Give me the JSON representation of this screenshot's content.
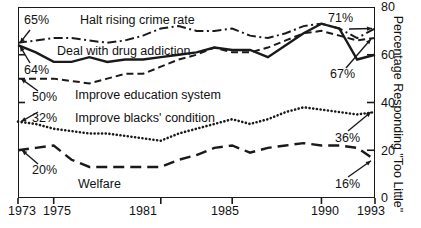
{
  "chart_data": {
    "type": "line",
    "title": "",
    "xlabel": "",
    "ylabel": "Percentage Responding \"Too Little\"",
    "xlim": [
      1973,
      1993
    ],
    "ylim": [
      0,
      80
    ],
    "grid": false,
    "legend_position": "inline-labels",
    "x_ticks": [
      1973,
      1975,
      1981,
      1985,
      1990,
      1993
    ],
    "x_tick_labels": [
      "1973",
      "1975",
      "1981",
      "1985",
      "1990",
      "1993"
    ],
    "y_ticks": [
      0,
      20,
      40,
      60,
      80
    ],
    "y_tick_labels": [
      "0",
      "20",
      "40",
      "60",
      "80"
    ],
    "y_axis_side": "right",
    "x": [
      1973,
      1974,
      1975,
      1976,
      1977,
      1978,
      1979,
      1980,
      1981,
      1982,
      1983,
      1984,
      1985,
      1986,
      1987,
      1988,
      1989,
      1990,
      1991,
      1992,
      1993
    ],
    "series": [
      {
        "name": "Halt rising crime rate",
        "style": "dash-dot",
        "values": [
          65,
          66,
          67,
          67,
          66,
          65,
          66,
          68,
          71,
          72,
          70,
          70,
          71,
          68,
          67,
          69,
          72,
          73,
          71,
          67,
          71
        ]
      },
      {
        "name": "Deal with drug addiction",
        "style": "solid",
        "values": [
          64,
          61,
          57,
          57,
          59,
          57,
          58,
          58,
          59,
          60,
          61,
          63,
          62,
          62,
          59,
          64,
          69,
          73,
          71,
          58,
          60
        ]
      },
      {
        "name": "Improve education system",
        "style": "dashed",
        "values": [
          50,
          50,
          50,
          49,
          48,
          50,
          52,
          52,
          55,
          58,
          60,
          63,
          61,
          61,
          63,
          66,
          69,
          70,
          68,
          66,
          67
        ]
      },
      {
        "name": "Improve blacks' condition",
        "style": "dotted",
        "values": [
          32,
          31,
          29,
          28,
          27,
          27,
          26,
          25,
          24,
          27,
          29,
          31,
          33,
          31,
          33,
          36,
          38,
          37,
          36,
          35,
          36
        ]
      },
      {
        "name": "Welfare",
        "style": "long-dash",
        "values": [
          20,
          21,
          22,
          16,
          13,
          13,
          13,
          13,
          13,
          16,
          18,
          21,
          22,
          19,
          21,
          22,
          23,
          22,
          22,
          21,
          16
        ]
      }
    ],
    "annotations": [
      {
        "text": "65%",
        "value": 65,
        "year": 1973,
        "side": "left"
      },
      {
        "text": "64%",
        "value": 64,
        "year": 1973,
        "side": "left"
      },
      {
        "text": "50%",
        "value": 50,
        "year": 1973,
        "side": "left"
      },
      {
        "text": "32%",
        "value": 32,
        "year": 1973,
        "side": "left"
      },
      {
        "text": "20%",
        "value": 20,
        "year": 1973,
        "side": "left"
      },
      {
        "text": "71%",
        "value": 71,
        "year": 1993,
        "side": "right"
      },
      {
        "text": "67%",
        "value": 67,
        "year": 1993,
        "side": "right"
      },
      {
        "text": "36%",
        "value": 36,
        "year": 1993,
        "side": "right"
      },
      {
        "text": "16%",
        "value": 16,
        "year": 1993,
        "side": "right"
      }
    ]
  },
  "axes": {
    "right_title": "Percentage Responding \"Too Little\"",
    "y_tick_labels": [
      "80",
      "60",
      "40",
      "20",
      "0"
    ],
    "x_tick_labels": [
      "1973",
      "1975",
      "1981",
      "1985",
      "1990",
      "1993"
    ]
  },
  "series_labels": {
    "crime": "Halt rising crime rate",
    "drugs": "Deal with drug addiction",
    "education": "Improve education system",
    "blacks": "Improve blacks' condition",
    "welfare": "Welfare"
  },
  "annotations": {
    "left_65": "65%",
    "left_64": "64%",
    "left_50": "50%",
    "left_32": "32%",
    "left_20": "20%",
    "right_71": "71%",
    "right_67": "67%",
    "right_36": "36%",
    "right_16": "16%"
  },
  "colors": {
    "ink": "#1a1a1a",
    "background": "#ffffff"
  }
}
